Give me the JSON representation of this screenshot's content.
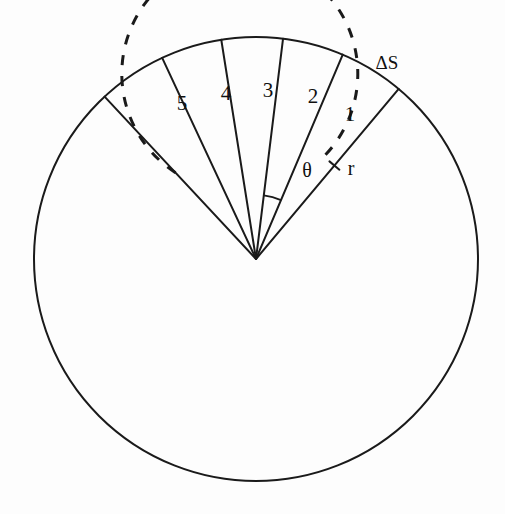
{
  "figure": {
    "background_color": "#fdfdfd",
    "stroke_color": "#1a1a1a",
    "outer_circle": {
      "center_x": 256,
      "center_y": 259,
      "radius": 222,
      "stroke_width": 2.0,
      "style": "solid"
    },
    "inner_circle": {
      "center_x": 256,
      "center_y": 259,
      "radius": 118,
      "stroke_width": 3.0,
      "style": "dashed",
      "dash_pattern": "10 11",
      "gap_start_deg": 57,
      "gap_end_deg": 133
    },
    "rays": [
      {
        "angle_deg": 50,
        "length": 222
      },
      {
        "angle_deg": 67,
        "length": 222
      },
      {
        "angle_deg": 83,
        "length": 222
      },
      {
        "angle_deg": 99,
        "length": 222
      },
      {
        "angle_deg": 115,
        "length": 222
      },
      {
        "angle_deg": 133,
        "length": 222
      }
    ],
    "angle_arc": {
      "radius": 64,
      "start_deg": 67,
      "end_deg": 83
    },
    "tick_mark": {
      "on_ray_angle_deg": 50,
      "distance": 122,
      "length": 13
    },
    "sector_labels": [
      {
        "text": "1",
        "x": 350,
        "y": 114
      },
      {
        "text": "2",
        "x": 313,
        "y": 96
      },
      {
        "text": "3",
        "x": 268,
        "y": 90
      },
      {
        "text": "4",
        "x": 226,
        "y": 93
      },
      {
        "text": "5",
        "x": 182,
        "y": 103
      }
    ],
    "symbol_labels": [
      {
        "name": "delta-s-label",
        "text": "ΔS",
        "x": 387,
        "y": 62
      },
      {
        "name": "theta-label",
        "text": "θ",
        "x": 307,
        "y": 170
      },
      {
        "name": "radius-label",
        "text": "r",
        "x": 351,
        "y": 168
      }
    ]
  }
}
